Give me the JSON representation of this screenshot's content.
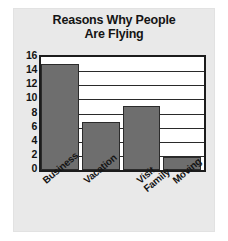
{
  "chart_data": {
    "type": "bar",
    "title": "Reasons Why People Are Flying",
    "title_line1": "Reasons Why People",
    "title_line2": "Are Flying",
    "xlabel": "",
    "ylabel": "",
    "categories": [
      "Business",
      "Vacation",
      "Visit Family",
      "Moving"
    ],
    "values": [
      15,
      6.8,
      9,
      1.8
    ],
    "ylim": [
      0,
      16
    ],
    "yticks": [
      0,
      2,
      4,
      6,
      8,
      10,
      12,
      14,
      16
    ],
    "ytick_labels": [
      "0",
      "2",
      "4",
      "6",
      "8",
      "10",
      "12",
      "14",
      "16"
    ],
    "grid": true,
    "grid_axis": "y",
    "legend": false,
    "legend_position": "none",
    "bar_color": "#6e6e6e",
    "bar_edge_color": "#2b2b2b",
    "plot_background": "#ffffff",
    "panel_background": "#e9e9e9",
    "frame_color": "#1c1c1c",
    "text_color": "#141414",
    "series": [
      {
        "name": "Reasons",
        "values": [
          15,
          6.8,
          9,
          1.8
        ]
      }
    ],
    "points": [
      {
        "category": "Business",
        "value": 15
      },
      {
        "category": "Vacation",
        "value": 6.8
      },
      {
        "category": "Visit Family",
        "value": 9
      },
      {
        "category": "Moving",
        "value": 1.8
      }
    ],
    "category_lines": [
      [
        "Business"
      ],
      [
        "Vacation"
      ],
      [
        "Visit",
        "Family"
      ],
      [
        "Moving"
      ]
    ]
  }
}
